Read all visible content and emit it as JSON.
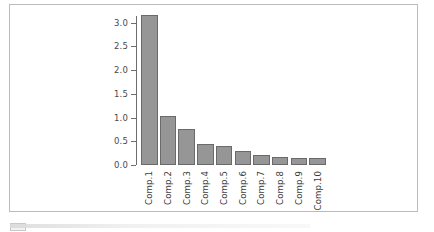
{
  "figure": {
    "kind": "scree-plot",
    "background_color": "#ffffff",
    "frame_border_color": "#b9bbbd"
  },
  "chart_data": {
    "type": "bar",
    "title": "",
    "subtitle": "",
    "xlabel": "",
    "ylabel": "",
    "categories": [
      "Comp.1",
      "Comp.2",
      "Comp.3",
      "Comp.4",
      "Comp.5",
      "Comp.6",
      "Comp.7",
      "Comp.8",
      "Comp.9",
      "Comp.10"
    ],
    "values": [
      3.15,
      1.03,
      0.76,
      0.45,
      0.39,
      0.3,
      0.21,
      0.17,
      0.14,
      0.14
    ],
    "ylim": [
      0.0,
      3.2
    ],
    "y_ticks": [
      0.0,
      0.5,
      1.0,
      1.5,
      2.0,
      2.5,
      3.0
    ],
    "y_tick_labels": [
      "0.0",
      "0.5",
      "1.0",
      "1.5",
      "2.0",
      "2.5",
      "3.0"
    ],
    "x_tick_labels_rotation_deg": 90,
    "grid": false,
    "legend": null,
    "legend_position": "none",
    "bar_fill_color": "#969696",
    "bar_border_color": "#6a6a6a",
    "axis_color": "#6e6e6e",
    "tick_label_color": "#4a4a4a"
  }
}
